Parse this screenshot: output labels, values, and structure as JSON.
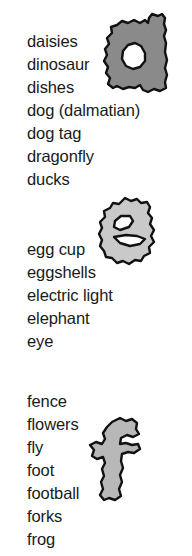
{
  "page": {
    "background_color": "#ffffff",
    "text_color": "#1a1a1a"
  },
  "sections": [
    {
      "letter": "d",
      "letter_icon": "letter-d-blob",
      "blob_fill": "#8a8a8a",
      "blob_stroke": "#111111",
      "words": [
        "daisies",
        "dinosaur",
        "dishes",
        "dog (dalmatian)",
        "dog tag",
        "dragonfly",
        "ducks"
      ]
    },
    {
      "letter": "e",
      "letter_icon": "letter-e-blob",
      "blob_fill": "#c9c9c9",
      "blob_stroke": "#111111",
      "words": [
        "egg cup",
        "eggshells",
        "electric light",
        "elephant",
        "eye"
      ]
    },
    {
      "letter": "f",
      "letter_icon": "letter-f-blob",
      "blob_fill": "#b8b8b8",
      "blob_stroke": "#111111",
      "words": [
        "fence",
        "flowers",
        "fly",
        "foot",
        "football",
        "forks",
        "frog"
      ]
    }
  ]
}
